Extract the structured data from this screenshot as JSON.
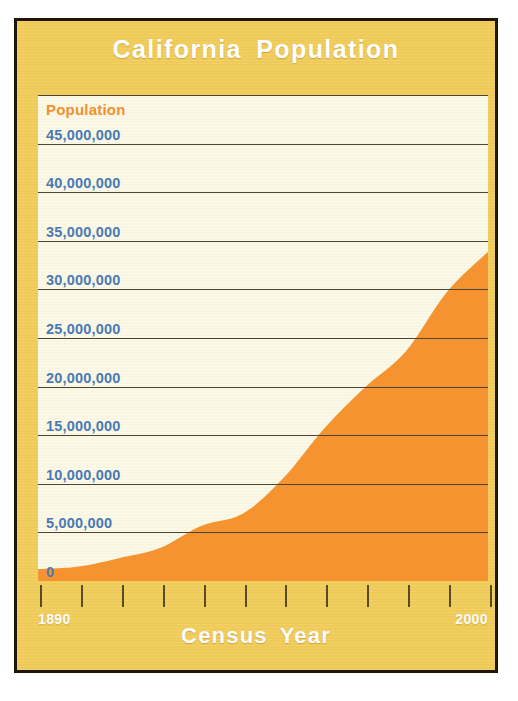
{
  "figure": {
    "title": "California Population",
    "frame_color": "#1f1508",
    "panel_color": "#f2ce5c",
    "plot_background": "#fdfae8"
  },
  "axis": {
    "y_title": "Population",
    "y_title_color": "#f0912f",
    "y_tick_color": "#4a79b4",
    "x_title": "Census Year",
    "x_first_label": "1890",
    "x_last_label": "2000"
  },
  "chart_data": {
    "type": "area",
    "title": "California Population",
    "xlabel": "Census Year",
    "ylabel": "Population",
    "xlim": [
      1890,
      2000
    ],
    "ylim": [
      0,
      50000000
    ],
    "grid": true,
    "legend": "none",
    "series_color": "#f59331",
    "x": [
      1890,
      1900,
      1910,
      1920,
      1930,
      1940,
      1950,
      1960,
      1970,
      1980,
      1990,
      2000
    ],
    "values": [
      1213000,
      1485000,
      2378000,
      3427000,
      5677000,
      6907000,
      10586000,
      15717000,
      19953000,
      23668000,
      29760000,
      33872000
    ],
    "categories": [
      "1890",
      "1900",
      "1910",
      "1920",
      "1930",
      "1940",
      "1950",
      "1960",
      "1970",
      "1980",
      "1990",
      "2000"
    ],
    "ytick_values": [
      50000000,
      45000000,
      40000000,
      35000000,
      30000000,
      25000000,
      20000000,
      15000000,
      10000000,
      5000000,
      0
    ],
    "ytick_labels": [
      "50,000,000",
      "45,000,000",
      "40,000,000",
      "35,000,000",
      "30,000,000",
      "25,000,000",
      "20,000,000",
      "15,000,000",
      "10,000,000",
      "5,000,000",
      "0"
    ]
  }
}
